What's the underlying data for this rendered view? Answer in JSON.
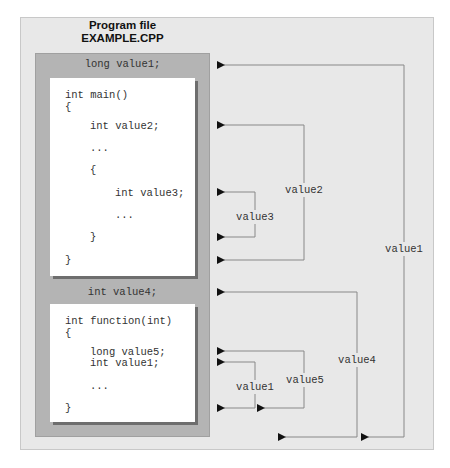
{
  "title": {
    "line1": "Program file",
    "line2": "EXAMPLE.CPP"
  },
  "global_scope": {
    "declaration": "long value1;"
  },
  "main_block": {
    "lines": [
      {
        "text": "int main()",
        "indent": 0
      },
      {
        "text": "{",
        "indent": 0
      },
      {
        "text": "int value2;",
        "indent": 1
      },
      {
        "text": "...",
        "indent": 1
      },
      {
        "text": "{",
        "indent": 1
      },
      {
        "text": "int value3;",
        "indent": 2
      },
      {
        "text": "...",
        "indent": 2
      },
      {
        "text": "}",
        "indent": 1
      },
      {
        "text": "}",
        "indent": 0
      }
    ]
  },
  "file_scope_2": {
    "declaration": "int value4;"
  },
  "function_block": {
    "lines": [
      {
        "text": "int function(int)",
        "indent": 0
      },
      {
        "text": "{",
        "indent": 0
      },
      {
        "text": "long value5;",
        "indent": 1
      },
      {
        "text": "int value1;",
        "indent": 1
      },
      {
        "text": "...",
        "indent": 1
      },
      {
        "text": "}",
        "indent": 0
      }
    ]
  },
  "scope_labels": {
    "value1_global": "value1",
    "value2": "value2",
    "value3": "value3",
    "value4": "value4",
    "value5": "value5",
    "value1_local": "value1"
  },
  "colors": {
    "outer_bg": "#e8e8e8",
    "mid_bg": "#b4b4b4",
    "code_bg": "#ffffff",
    "line": "#888888",
    "arrow": "#111111"
  }
}
